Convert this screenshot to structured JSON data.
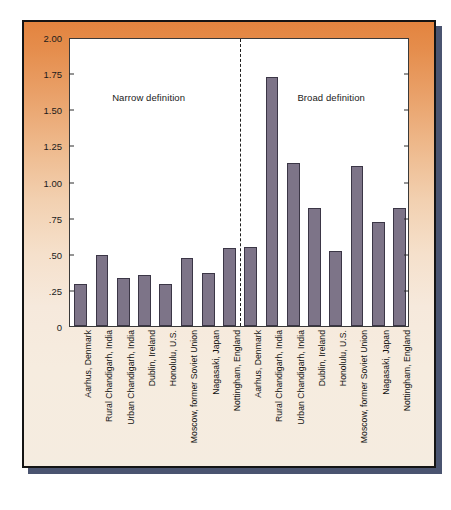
{
  "figure": {
    "y_axis_title": "Lifetime morbid risk (in percents)",
    "section_labels": {
      "narrow": "Narrow definition",
      "broad": "Broad definition"
    },
    "colors": {
      "bar_fill": "#7d7488",
      "bar_border": "#3b3646",
      "panel_top": "#e3843f",
      "panel_bottom": "#f5ece0",
      "plot_background": "#ffffff",
      "frame_border": "#141414",
      "shadow": "#4a5470"
    }
  },
  "chart_data": {
    "type": "bar",
    "title": "",
    "xlabel": "",
    "ylabel": "Lifetime morbid risk (in percents)",
    "ylim": [
      0,
      2.0
    ],
    "ytick_labels": [
      "2.00",
      "1.75",
      "1.50",
      "1.25",
      "1.00",
      ".75",
      ".50",
      ".25",
      "0"
    ],
    "ytick_values": [
      2.0,
      1.75,
      1.5,
      1.25,
      1.0,
      0.75,
      0.5,
      0.25,
      0
    ],
    "grid": false,
    "legend": "none",
    "annotations": [
      "Narrow definition",
      "Broad definition"
    ],
    "divider_after_index": 7,
    "categories": [
      "Aarhus, Denmark",
      "Rural Chandigarh, India",
      "Urban Chandigarh, India",
      "Dublin, Ireland",
      "Honolulu, U.S.",
      "Moscow, former Soviet Union",
      "Nagasaki, Japan",
      "Nottingham, England",
      "Aarhus, Denmark",
      "Rural Chandigarh, India",
      "Urban Chandigarh, India",
      "Dublin, Ireland",
      "Honolulu, U.S.",
      "Moscow, former Soviet Union",
      "Nagasaki, Japan",
      "Nottingham, England"
    ],
    "groups": [
      "Narrow definition",
      "Narrow definition",
      "Narrow definition",
      "Narrow definition",
      "Narrow definition",
      "Narrow definition",
      "Narrow definition",
      "Narrow definition",
      "Broad definition",
      "Broad definition",
      "Broad definition",
      "Broad definition",
      "Broad definition",
      "Broad definition",
      "Broad definition",
      "Broad definition"
    ],
    "values": [
      0.29,
      0.49,
      0.33,
      0.35,
      0.29,
      0.47,
      0.37,
      0.54,
      0.55,
      1.72,
      1.13,
      0.82,
      0.52,
      1.11,
      0.72,
      0.82
    ]
  }
}
